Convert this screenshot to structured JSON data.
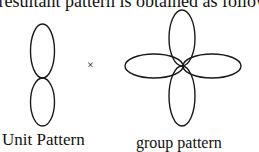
{
  "caption": "e resultant pattern is obtained as follows:",
  "operator": "×",
  "labels": {
    "unit": "Unit Pattern",
    "group": "group pattern"
  },
  "diagram": {
    "unit_pattern": {
      "lobes": 2,
      "orientation": "vertical"
    },
    "group_pattern": {
      "lobes": 4,
      "orientation": "cross"
    },
    "stroke_color": "#1a1a1a"
  }
}
